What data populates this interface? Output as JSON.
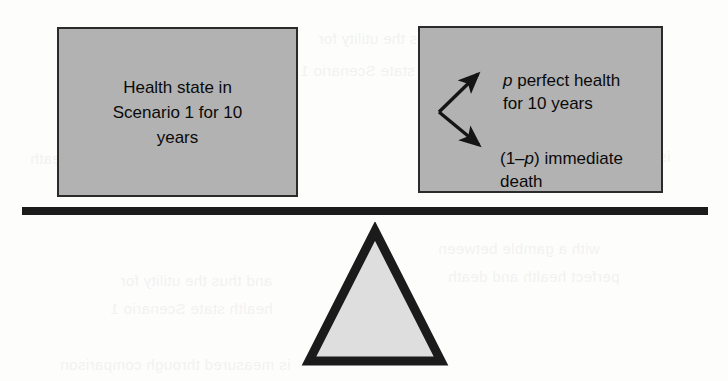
{
  "figure": {
    "name": "standard-gamble-balance-diagram"
  },
  "left_box": {
    "text": "Health state in\nScenario 1 for 10\nyears"
  },
  "right_box": {
    "branches": [
      {
        "id": "upper",
        "probability": "p",
        "text_after_probability": " perfect health\nfor 10 years",
        "full_text": "p perfect health for 10 years"
      },
      {
        "id": "lower",
        "probability_prefix": "(1–",
        "probability": "p",
        "probability_suffix": ")",
        "text_after_probability": " immediate\ndeath",
        "full_text": "(1–p) immediate death"
      }
    ]
  },
  "colors": {
    "box_fill": "#b2b2b2",
    "box_border": "#2b2b2b",
    "text": "#0a0a0a",
    "beam": "#1b1b1b",
    "triangle_fill": "#dedede",
    "triangle_border": "#1b1b1b",
    "page_background": "#fdfdfc"
  },
  "beam": {
    "label": "balance-beam"
  },
  "fulcrum": {
    "label": "fulcrum-triangle"
  },
  "bleed_through": {
    "lines": [
      "and thus the utility for",
      "health state Scenario 1",
      "is measured through comparison",
      "with a gamble between",
      "perfect health and death"
    ]
  }
}
